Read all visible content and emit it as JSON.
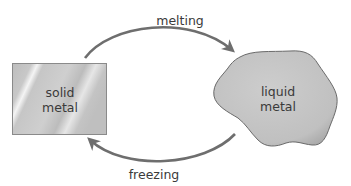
{
  "diagram": {
    "nodes": {
      "solid": {
        "line1": "solid",
        "line2": "metal"
      },
      "liquid": {
        "line1": "liquid",
        "line2": "metal"
      }
    },
    "edges": {
      "melting": {
        "label": "melting",
        "from": "solid metal",
        "to": "liquid metal"
      },
      "freezing": {
        "label": "freezing",
        "from": "liquid metal",
        "to": "solid metal"
      }
    }
  },
  "colors": {
    "arrow": "#6e6e6e",
    "box_fill": "#c9c9c9",
    "blob_fill": "#c2c2c2",
    "outline": "#7a7a7a",
    "text": "#3a3a3a"
  }
}
